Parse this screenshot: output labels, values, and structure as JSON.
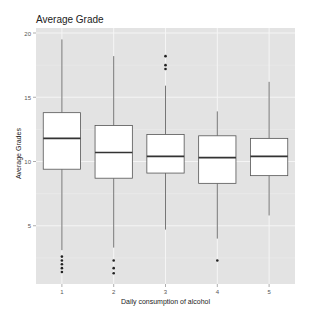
{
  "chart_data": {
    "type": "boxplot",
    "title": "Average Grade",
    "xlabel": "Daily consumption of alcohol",
    "ylabel": "Average Grades",
    "categories": [
      "1",
      "2",
      "3",
      "4",
      "5"
    ],
    "yticks": [
      5,
      10,
      15,
      20
    ],
    "ylim": [
      0.5,
      20.4
    ],
    "grid": true,
    "legend": null,
    "boxes": [
      {
        "category": "1",
        "whisker_low": 3.1,
        "q1": 9.4,
        "median": 11.8,
        "q3": 13.8,
        "whisker_high": 19.5,
        "outliers": [
          2.6,
          2.3,
          2.0,
          1.7,
          1.4
        ]
      },
      {
        "category": "2",
        "whisker_low": 3.3,
        "q1": 8.7,
        "median": 10.7,
        "q3": 12.8,
        "whisker_high": 18.2,
        "outliers": [
          2.3,
          1.7,
          1.3
        ]
      },
      {
        "category": "3",
        "whisker_low": 4.7,
        "q1": 9.1,
        "median": 10.4,
        "q3": 12.1,
        "whisker_high": 15.9,
        "outliers": [
          18.2,
          17.5,
          17.2
        ]
      },
      {
        "category": "4",
        "whisker_low": 4.0,
        "q1": 8.3,
        "median": 10.3,
        "q3": 12.0,
        "whisker_high": 13.9,
        "outliers": [
          2.3
        ]
      },
      {
        "category": "5",
        "whisker_low": 5.8,
        "q1": 8.9,
        "median": 10.4,
        "q3": 11.8,
        "whisker_high": 16.2,
        "outliers": []
      }
    ],
    "colors": {
      "panel": "#e3e3e3",
      "grid": "#f5f5f5",
      "box_fill": "#ffffff",
      "box_line": "#555555",
      "median": "#333333",
      "outlier": "#222222"
    }
  }
}
